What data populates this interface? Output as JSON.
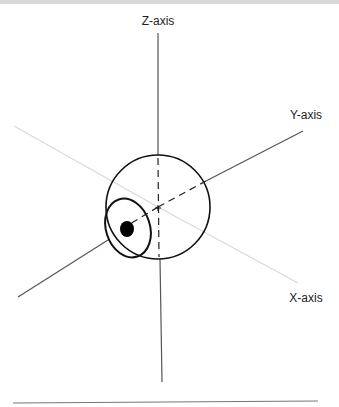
{
  "figure": {
    "labels": {
      "z_axis": "Z-axis",
      "y_axis": "Y-axis",
      "x_axis": "X-axis"
    },
    "colors": {
      "axis_dark": "#555555",
      "axis_light": "#d6d6d6",
      "outline": "#111111",
      "pupil": "#000000"
    }
  }
}
